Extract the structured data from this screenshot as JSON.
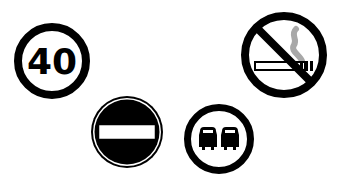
{
  "scene": {
    "background": "#ffffff",
    "ink": "#000000",
    "smoke_color": "#a8a8a8"
  },
  "signs": [
    {
      "type": "speed-limit",
      "label": "40",
      "cx": 52,
      "cy": 61,
      "r": 38
    },
    {
      "type": "no-smoking",
      "cx": 284,
      "cy": 55,
      "r": 43
    },
    {
      "type": "no-entry",
      "cx": 127,
      "cy": 132,
      "r": 36
    },
    {
      "type": "no-overtaking",
      "cx": 219,
      "cy": 139,
      "r": 35
    }
  ]
}
